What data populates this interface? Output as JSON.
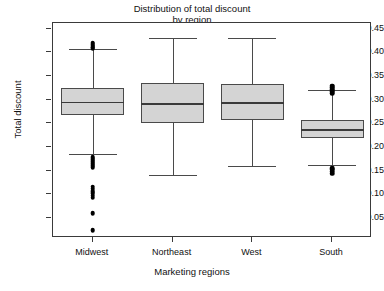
{
  "chart_data": {
    "type": "boxplot",
    "title": "Distribution of total discount by region",
    "title_lines": [
      "Distribution of total discount",
      "by region"
    ],
    "xlabel": "Marketing regions",
    "ylabel": "Total discount",
    "categories": [
      "Midwest",
      "Northeast",
      "West",
      "South"
    ],
    "ylim": [
      0.008,
      0.462
    ],
    "yticks": [
      0.45,
      0.4,
      0.35,
      0.3,
      0.25,
      0.2,
      0.15,
      0.1,
      0.05
    ],
    "ytick_labels": [
      "0.45",
      "0.40",
      "0.35",
      "0.30",
      "0.25",
      "0.20",
      "0.15",
      "0.10",
      "0.05"
    ],
    "grid": false,
    "legend": null,
    "box_color": "#d4d4d4",
    "line_color": "#4a4a4a",
    "outlier_color": "#000000",
    "boxes": [
      {
        "name": "Midwest",
        "whisker_low": 0.186,
        "q1": 0.268,
        "median": 0.296,
        "q3": 0.324,
        "whisker_high": 0.407,
        "outliers": [
          0.42,
          0.417,
          0.414,
          0.411,
          0.409,
          0.178,
          0.174,
          0.17,
          0.166,
          0.162,
          0.158,
          0.116,
          0.112,
          0.107,
          0.102,
          0.097,
          0.093,
          0.06,
          0.025
        ]
      },
      {
        "name": "Northeast",
        "whisker_low": 0.142,
        "q1": 0.25,
        "median": 0.293,
        "q3": 0.335,
        "whisker_high": 0.43,
        "outliers": []
      },
      {
        "name": "West",
        "whisker_low": 0.16,
        "q1": 0.257,
        "median": 0.295,
        "q3": 0.333,
        "whisker_high": 0.43,
        "outliers": []
      },
      {
        "name": "South",
        "whisker_low": 0.162,
        "q1": 0.22,
        "median": 0.238,
        "q3": 0.258,
        "whisker_high": 0.321,
        "outliers": [
          0.33,
          0.326,
          0.322,
          0.318,
          0.314,
          0.156,
          0.152,
          0.148,
          0.144
        ]
      }
    ]
  }
}
